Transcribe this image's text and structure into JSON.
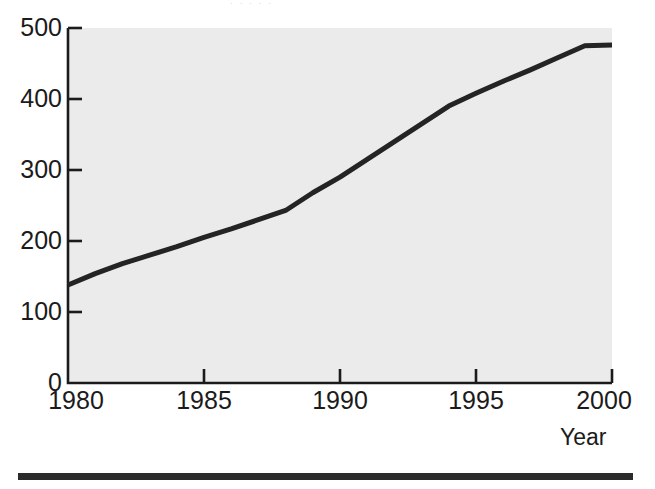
{
  "figure": {
    "title_remnant": "· · ·     ·  ·",
    "background_color": "#ffffff",
    "plot_background_color": "#ebebeb",
    "axis_color": "#1b1b1b",
    "line_color": "#242424",
    "rule_color": "#2b2b2b"
  },
  "axis": {
    "x_title": "Year",
    "y_title": ""
  },
  "chart_data": {
    "type": "line",
    "title": "",
    "subtitle": "",
    "xlabel": "Year",
    "ylabel": "",
    "xlim": [
      1980,
      2000
    ],
    "ylim": [
      0,
      500
    ],
    "xticks": [
      1980,
      1985,
      1990,
      1995,
      2000
    ],
    "xtick_labels": [
      "1980",
      "1985",
      "1990",
      "1995",
      "2000"
    ],
    "yticks": [
      0,
      100,
      200,
      300,
      400,
      500
    ],
    "ytick_labels": [
      "0",
      "100",
      "200",
      "300",
      "400",
      "500"
    ],
    "grid": false,
    "legend": null,
    "legend_position": "none",
    "annotations": [],
    "series": [
      {
        "name": "series-1",
        "color": "#242424",
        "line_width": 5,
        "x": [
          1980,
          1981,
          1982,
          1983,
          1984,
          1985,
          1986,
          1987,
          1988,
          1989,
          1990,
          1991,
          1992,
          1993,
          1994,
          1995,
          1996,
          1997,
          1998,
          1999,
          2000
        ],
        "values": [
          138,
          154,
          168,
          180,
          192,
          205,
          217,
          230,
          243,
          268,
          290,
          315,
          340,
          365,
          390,
          408,
          425,
          441,
          458,
          475,
          476
        ]
      }
    ]
  }
}
